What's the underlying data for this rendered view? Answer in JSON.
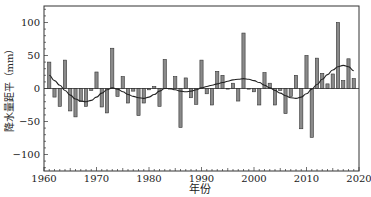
{
  "chart_data": {
    "type": "bar",
    "title": "",
    "xlabel": "年份",
    "ylabel": "降水量距平（mm）",
    "xlim": [
      1960,
      2020
    ],
    "ylim": [
      -125,
      125
    ],
    "xticks": [
      1960,
      1970,
      1980,
      1990,
      2000,
      2010,
      2020
    ],
    "yticks": [
      -100,
      -50,
      0,
      50,
      100
    ],
    "grid": false,
    "legend": null,
    "series": [
      {
        "name": "降水量距平",
        "kind": "bar",
        "x": [
          1961,
          1962,
          1963,
          1964,
          1965,
          1966,
          1967,
          1968,
          1969,
          1970,
          1971,
          1972,
          1973,
          1974,
          1975,
          1976,
          1977,
          1978,
          1979,
          1980,
          1981,
          1982,
          1983,
          1984,
          1985,
          1986,
          1987,
          1988,
          1989,
          1990,
          1991,
          1992,
          1993,
          1994,
          1995,
          1996,
          1997,
          1998,
          1999,
          2000,
          2001,
          2002,
          2003,
          2004,
          2005,
          2006,
          2007,
          2008,
          2009,
          2010,
          2011,
          2012,
          2013,
          2014,
          2015,
          2016,
          2017,
          2018,
          2019
        ],
        "values": [
          40,
          -13,
          -27,
          43,
          -34,
          -43,
          -20,
          -27,
          -3,
          25,
          -28,
          -37,
          61,
          -12,
          18,
          -22,
          -4,
          -41,
          -22,
          -2,
          3,
          -27,
          44,
          0,
          18,
          -59,
          16,
          -14,
          -24,
          43,
          -8,
          -25,
          26,
          20,
          0,
          8,
          -19,
          84,
          -1,
          -5,
          -25,
          24,
          8,
          -25,
          -3,
          -38,
          -12,
          20,
          -61,
          50,
          -74,
          46,
          23,
          7,
          22,
          100,
          12,
          45,
          15
        ]
      },
      {
        "name": "平滑曲线",
        "kind": "line",
        "x": [
          1961,
          1962,
          1963,
          1964,
          1965,
          1966,
          1967,
          1968,
          1969,
          1970,
          1971,
          1972,
          1973,
          1974,
          1975,
          1976,
          1977,
          1978,
          1979,
          1980,
          1981,
          1982,
          1983,
          1984,
          1985,
          1986,
          1987,
          1988,
          1989,
          1990,
          1991,
          1992,
          1993,
          1994,
          1995,
          1996,
          1997,
          1998,
          1999,
          2000,
          2001,
          2002,
          2003,
          2004,
          2005,
          2006,
          2007,
          2008,
          2009,
          2010,
          2011,
          2012,
          2013,
          2014,
          2015,
          2016,
          2017,
          2018,
          2019
        ],
        "values": [
          20,
          12,
          5,
          -3,
          -10,
          -16,
          -19,
          -20,
          -18,
          -13,
          -7,
          -2,
          1,
          -1,
          -5,
          -9,
          -12,
          -14,
          -15,
          -13,
          -9,
          -4,
          0,
          0,
          -2,
          -4,
          -5,
          -4,
          -2,
          1,
          3,
          5,
          7,
          9,
          11,
          13,
          14,
          15,
          14,
          12,
          9,
          5,
          1,
          -3,
          -7,
          -11,
          -14,
          -15,
          -13,
          -8,
          -1,
          6,
          14,
          21,
          28,
          33,
          35,
          33,
          27
        ]
      }
    ],
    "colors": {
      "bar_fill": "#8a8a8a",
      "bar_edge": "#333333",
      "line": "#222222",
      "axis": "#333333"
    }
  }
}
